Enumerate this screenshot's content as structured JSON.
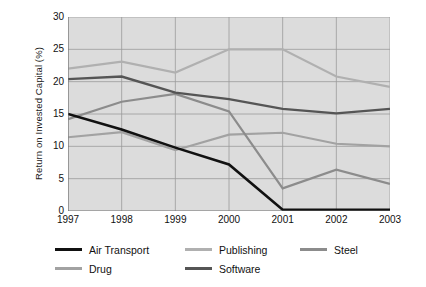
{
  "chart_data": {
    "type": "line",
    "title": "",
    "xlabel": "",
    "ylabel": "Return on Invested Capital (%)",
    "categories": [
      "1997",
      "1998",
      "1999",
      "2000",
      "2001",
      "2002",
      "2003"
    ],
    "x": [
      1997,
      1998,
      1999,
      2000,
      2001,
      2002,
      2003
    ],
    "ylim": [
      0,
      30
    ],
    "yticks": [
      0,
      5,
      10,
      15,
      20,
      25,
      30
    ],
    "grid": true,
    "legend_position": "bottom",
    "series": [
      {
        "name": "Air Transport",
        "color": "#111111",
        "width": 2.6,
        "values": [
          15.0,
          12.6,
          9.8,
          7.2,
          0.2,
          0.2,
          0.2
        ]
      },
      {
        "name": "Publishing",
        "color": "#b0b0b0",
        "width": 2.2,
        "values": [
          22.0,
          23.1,
          21.4,
          25.0,
          25.0,
          20.8,
          19.2
        ]
      },
      {
        "name": "Steel",
        "color": "#8c8c8c",
        "width": 2.2,
        "values": [
          14.2,
          16.9,
          18.1,
          15.4,
          3.5,
          6.4,
          4.2
        ]
      },
      {
        "name": "Drug",
        "color": "#a2a2a2",
        "width": 2.2,
        "values": [
          11.4,
          12.2,
          9.4,
          11.8,
          12.1,
          10.4,
          10.0
        ]
      },
      {
        "name": "Software",
        "color": "#555555",
        "width": 2.4,
        "values": [
          20.4,
          20.8,
          18.3,
          17.3,
          15.8,
          15.1,
          15.8
        ]
      }
    ]
  },
  "legend": {
    "rows": [
      [
        "Air Transport",
        "Publishing",
        "Steel"
      ],
      [
        "Drug",
        "Software"
      ]
    ]
  },
  "colors": {
    "plot_background": "#dcdcdc",
    "gridline": "#9a9a9a",
    "axis": "#6f6f6f",
    "text": "#111111",
    "page_background": "#ffffff"
  }
}
